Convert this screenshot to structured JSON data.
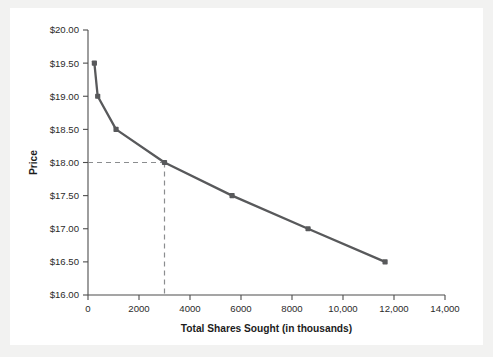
{
  "chart_data": {
    "type": "line",
    "title": "",
    "xlabel": "Total Shares Sought (in thousands)",
    "ylabel": "Price",
    "xlim": [
      0,
      14000
    ],
    "ylim": [
      16.0,
      20.0
    ],
    "grid": false,
    "legend": null,
    "x_ticks": [
      0,
      2000,
      4000,
      6000,
      8000,
      10000,
      12000,
      14000
    ],
    "x_tick_labels": [
      "0",
      "2000",
      "4000",
      "6000",
      "8000",
      "10,000",
      "12,000",
      "14,000"
    ],
    "y_ticks": [
      16.0,
      16.5,
      17.0,
      17.5,
      18.0,
      18.5,
      19.0,
      19.5,
      20.0
    ],
    "y_tick_labels": [
      "$16.00",
      "$16.50",
      "$17.00",
      "$17.50",
      "$18.00",
      "$18.50",
      "$19.00",
      "$19.50",
      "$20.00"
    ],
    "series": [
      {
        "name": "Demand curve",
        "color": "#58595b",
        "x": [
          250,
          380,
          1100,
          3000,
          5650,
          8630,
          11650
        ],
        "y": [
          19.5,
          19.0,
          18.5,
          18.0,
          17.5,
          17.0,
          16.5
        ]
      }
    ],
    "annotations": [
      {
        "name": "clearing-price-guide",
        "type": "crosshair",
        "x": 3000,
        "y": 18.0,
        "style": "dashed",
        "color": "#8b8d8f"
      }
    ]
  },
  "colors": {
    "line": "#58595b",
    "axis": "#4d4d4d",
    "guide": "#8b8d8f",
    "text": "#2b2b2b",
    "background": "#ffffff",
    "page": "#f2f2f1"
  }
}
